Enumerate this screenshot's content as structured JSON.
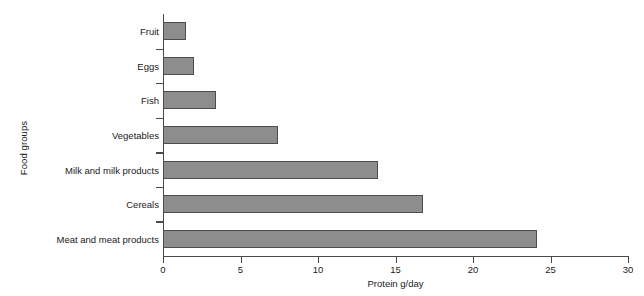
{
  "chart_data": {
    "type": "bar",
    "orientation": "horizontal",
    "title": "",
    "xlabel": "Protein g/day",
    "ylabel": "Food groups",
    "categories": [
      "Fruit",
      "Eggs",
      "Fish",
      "Vegetables",
      "Milk and milk products",
      "Cereals",
      "Meat and meat products"
    ],
    "values": [
      1.5,
      2.0,
      3.4,
      7.4,
      13.9,
      16.8,
      24.1
    ],
    "xlim": [
      0,
      30
    ],
    "xticks": [
      0,
      5,
      10,
      15,
      20,
      25,
      30
    ],
    "xtick_labels": [
      "0",
      "5",
      "10",
      "15",
      "20",
      "25",
      "30"
    ],
    "grid": false,
    "legend": false,
    "bar_color": "#8d8d8d",
    "bar_edge_color": "#4d4d4d",
    "axis_color": "#4a4a4a"
  }
}
